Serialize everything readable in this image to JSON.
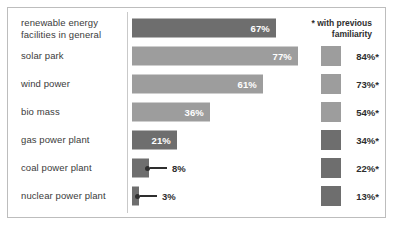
{
  "legend": {
    "note": "* with previous familiarity",
    "note_line1": "* with previous",
    "note_line2": "familiarity"
  },
  "chart_data": {
    "type": "bar",
    "title": "",
    "subtitle": "",
    "xlabel": "",
    "ylabel": "",
    "xlim": [
      0,
      100
    ],
    "grid": false,
    "legend_position": "top-right",
    "orientation": "horizontal",
    "annotations": [
      "* with previous familiarity"
    ],
    "categories": [
      "renewable energy facilities in general",
      "solar park",
      "wind power",
      "bio mass",
      "gas power plant",
      "coal power plant",
      "nuclear power plant"
    ],
    "series": [
      {
        "name": "overall",
        "values": [
          67,
          77,
          61,
          36,
          21,
          8,
          3
        ],
        "labels": [
          "67%",
          "77%",
          "61%",
          "36%",
          "21%",
          "8%",
          "3%"
        ]
      },
      {
        "name": "with previous familiarity",
        "values": [
          null,
          84,
          73,
          54,
          34,
          22,
          13
        ],
        "labels": [
          "",
          "84%*",
          "73%*",
          "54%*",
          "34%*",
          "22%*",
          "13%*"
        ]
      }
    ]
  },
  "rows": [
    {
      "label_line1": "renewable energy",
      "label_line2": "facilities in general",
      "value": "67%",
      "pct": 67,
      "tone": "dark",
      "label_inside": true,
      "right_value": "",
      "right_tone": "",
      "has_right": false
    },
    {
      "label_line1": "solar park",
      "label_line2": "",
      "value": "77%",
      "pct": 77,
      "tone": "light",
      "label_inside": true,
      "right_value": "84%*",
      "right_tone": "light",
      "has_right": true
    },
    {
      "label_line1": "wind power",
      "label_line2": "",
      "value": "61%",
      "pct": 61,
      "tone": "light",
      "label_inside": true,
      "right_value": "73%*",
      "right_tone": "light",
      "has_right": true
    },
    {
      "label_line1": "bio mass",
      "label_line2": "",
      "value": "36%",
      "pct": 36,
      "tone": "light",
      "label_inside": true,
      "right_value": "54%*",
      "right_tone": "light",
      "has_right": true
    },
    {
      "label_line1": "gas power plant",
      "label_line2": "",
      "value": "21%",
      "pct": 21,
      "tone": "dark",
      "label_inside": true,
      "right_value": "34%*",
      "right_tone": "dark",
      "has_right": true
    },
    {
      "label_line1": "coal power plant",
      "label_line2": "",
      "value": "8%",
      "pct": 8,
      "tone": "dark",
      "label_inside": false,
      "right_value": "22%*",
      "right_tone": "dark",
      "has_right": true
    },
    {
      "label_line1": "nuclear power plant",
      "label_line2": "",
      "value": "3%",
      "pct": 3,
      "tone": "dark",
      "label_inside": false,
      "right_value": "13%*",
      "right_tone": "dark",
      "has_right": true
    }
  ],
  "colors": {
    "bar_dark": "#6e6e6e",
    "bar_light": "#9d9d9d",
    "text": "#2e2e2e",
    "label_text": "#3b3b3b",
    "border": "#bdbdbd",
    "divider": "#c9c9c9",
    "background": "#ffffff"
  }
}
